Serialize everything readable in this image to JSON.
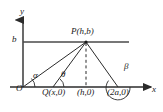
{
  "figure": {
    "background_color": "#ffffff",
    "stroke_color": "#2b2b2b",
    "axes": {
      "y_label": "y",
      "x_label": "x",
      "origin_label": "O"
    },
    "points": [
      {
        "name": "origin",
        "label": "O",
        "x_px": 23,
        "y_px": 87
      },
      {
        "name": "point-q",
        "label": "Q(x,0)",
        "x_px": 53,
        "y_px": 87
      },
      {
        "name": "point-foot",
        "label": "(h,0)",
        "x_px": 86,
        "y_px": 87
      },
      {
        "name": "point-2a",
        "label": "(2a,0)",
        "x_px": 118,
        "y_px": 87
      },
      {
        "name": "point-p",
        "label": "P(h,b)",
        "x_px": 86,
        "y_px": 42
      }
    ],
    "gridline": {
      "name": "horizontal-line-at-b",
      "label": "b",
      "y_px": 42
    },
    "angles": [
      {
        "name": "angle-alpha",
        "label": "α",
        "vertex": "O"
      },
      {
        "name": "angle-theta",
        "label": "θ",
        "vertex": "Q(x,0)"
      },
      {
        "name": "angle-beta",
        "label": "β",
        "vertex": "(2a,0)"
      }
    ],
    "segments": [
      {
        "name": "segment-o-to-p",
        "from": "O",
        "to": "P(h,b)",
        "style": "solid"
      },
      {
        "name": "segment-q-to-p",
        "from": "Q(x,0)",
        "to": "P(h,b)",
        "style": "solid"
      },
      {
        "name": "segment-2a-to-p",
        "from": "(2a,0)",
        "to": "P(h,b)",
        "style": "solid"
      },
      {
        "name": "segment-p-to-foot",
        "from": "P(h,b)",
        "to": "(h,0)",
        "style": "dashed"
      }
    ]
  }
}
